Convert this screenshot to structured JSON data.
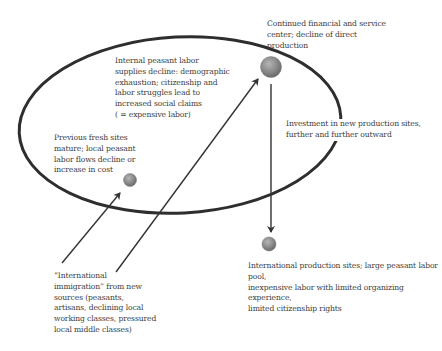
{
  "diagram": {
    "type": "cycle-of-capital-and-labor-migration",
    "colors": {
      "ellipse_stroke": "#2e2e2e",
      "arrow_stroke": "#333333",
      "node_fill": "#8a8a8a",
      "text": "#3c3c3c"
    },
    "nodes": [
      {
        "id": "center",
        "label": "Continued financial and service center; decline of direct production"
      },
      {
        "id": "previous",
        "label": "Previous fresh sites mature; local peasant labor flows decline or increase in cost"
      },
      {
        "id": "international_sites",
        "label": "International production sites; large peasant labor pool, inexpensive labor with limited organizing experience, limited citizenship rights"
      }
    ],
    "labels": {
      "center": "Continued financial and service\ncenter; decline of direct\nproduction",
      "internal": "Internal peasant labor\nsupplies decline: demographic\nexhaustion; citizenship and\nlabor struggles lead to\nincreased social claims\n( = expensive labor)",
      "previous": "Previous fresh sites\nmature; local peasant\nlabor flows decline or\nincrease in cost",
      "investment": "Investment in new production sites,\nfurther and further outward",
      "international_sites": "International production sites; large peasant labor pool,\ninexpensive labor with limited organizing experience,\nlimited citizenship rights",
      "immigration": "“International\nimmigration” from new\nsources (peasants,\nartisans, declining local\nworking classes, pressured\nlocal middle classes)"
    },
    "edges": [
      {
        "from": "immigration",
        "to": "previous"
      },
      {
        "from": "immigration",
        "to": "center"
      },
      {
        "from": "center",
        "to": "international_sites",
        "label": "Investment in new production sites, further and further outward"
      }
    ]
  }
}
